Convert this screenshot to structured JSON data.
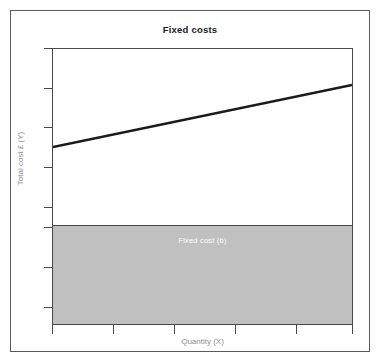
{
  "chart_data": {
    "type": "line",
    "title": "Fixed costs",
    "xlabel": "Quantity (X)",
    "ylabel": "Total cost £ (Y)",
    "grid": false,
    "legend": null,
    "xlim": [
      0,
      300
    ],
    "ylim": [
      0,
      277
    ],
    "x_tick_count": 6,
    "y_tick_count": 8,
    "x_ticks": [
      0,
      61,
      122,
      183,
      244,
      301
    ],
    "y_ticks": [
      0,
      40,
      79,
      119,
      159,
      179,
      219,
      259
    ],
    "annotations": [
      {
        "text": "Fixed cost (b)",
        "region": "shaded-band",
        "color": "#ffffff"
      }
    ],
    "series": [
      {
        "name": "Total cost",
        "type": "line",
        "color": "#1a1a1a",
        "width": 2.4,
        "x": [
          0,
          301
        ],
        "y": [
          179,
          241
        ],
        "description": "Total cost line rising from the fixed cost intercept b"
      },
      {
        "name": "Fixed cost (b)",
        "type": "area",
        "color": "#c0c0c0",
        "x": [
          0,
          301
        ],
        "y": [
          179,
          179
        ],
        "description": "Constant fixed cost band from origin up to intercept b"
      }
    ]
  },
  "colors": {
    "frame": "#5a5a5a",
    "axis": "#4a4a4a",
    "band_fill": "#c0c0c0",
    "line": "#1a1a1a",
    "axis_label": "#8e8e8e",
    "title": "#1a1a1a",
    "band_label": "#ffffff",
    "background": "#ffffff"
  }
}
